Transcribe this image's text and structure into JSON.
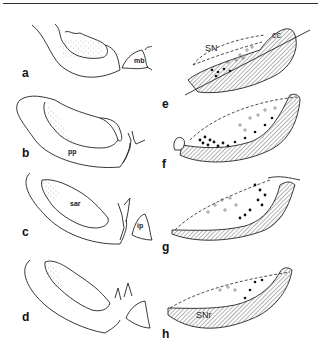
{
  "figure": {
    "panels": [
      {
        "id": "a",
        "label": "a",
        "structures": [
          "mb"
        ]
      },
      {
        "id": "b",
        "label": "b",
        "structures": [
          "pp"
        ]
      },
      {
        "id": "c",
        "label": "c",
        "structures": [
          "sar",
          "ip"
        ]
      },
      {
        "id": "d",
        "label": "d",
        "structures": []
      },
      {
        "id": "e",
        "label": "e",
        "structures": [
          "SN",
          "cc"
        ]
      },
      {
        "id": "f",
        "label": "f",
        "structures": []
      },
      {
        "id": "g",
        "label": "g",
        "structures": []
      },
      {
        "id": "h",
        "label": "h",
        "structures": [
          "SNr"
        ]
      }
    ],
    "labels": {
      "a": "a",
      "b": "b",
      "c": "c",
      "d": "d",
      "e": "e",
      "f": "f",
      "g": "g",
      "h": "h",
      "mb": "mb",
      "pp": "pp",
      "sar": "sar",
      "ip": "ip",
      "SN": "SN",
      "cc": "cc",
      "SNr": "SNr"
    },
    "legend_markers": {
      "open_circle": "open-circle-cells",
      "filled_circle": "filled-circle-cells",
      "stipple": "stippled-region",
      "hatch": "hatched-region"
    }
  }
}
